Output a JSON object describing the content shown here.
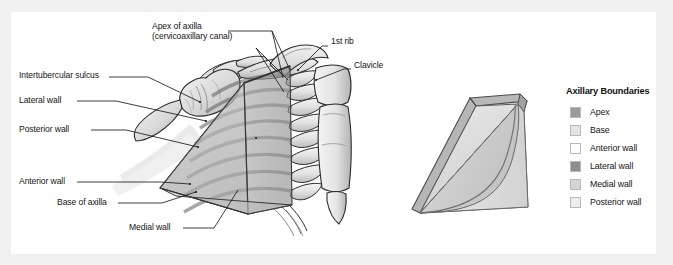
{
  "figure": {
    "panel_background": "#ffffff",
    "outer_background": "#f0f0f0"
  },
  "labels": {
    "apex_of_axilla": "Apex of axilla",
    "cervicoaxillary_canal": "(cervicoaxillary canal)",
    "first_rib": "1st rib",
    "clavicle": "Clavicle",
    "intertubercular_sulcus": "Intertubercular sulcus",
    "lateral_wall": "Lateral wall",
    "posterior_wall": "Posterior wall",
    "anterior_wall": "Anterior wall",
    "base_of_axilla": "Base of axilla",
    "medial_wall": "Medial wall"
  },
  "legend": {
    "title": "Axillary Boundaries",
    "items": [
      {
        "label": "Apex",
        "color": "#9a9a9a"
      },
      {
        "label": "Base",
        "color": "#e4e4e4"
      },
      {
        "label": "Anterior wall",
        "color": "#ffffff"
      },
      {
        "label": "Lateral wall",
        "color": "#8e8e8e"
      },
      {
        "label": "Medial wall",
        "color": "#d4d4d4"
      },
      {
        "label": "Posterior wall",
        "color": "#ededed"
      }
    ]
  },
  "colors": {
    "line": "#1c1c1c",
    "bone_light": "#efefef",
    "bone_mid": "#d2d2d2",
    "bone_shadow": "#a8a8a8",
    "pyramid_anterior": "#b5b5b5",
    "pyramid_medial": "#9e9e9e",
    "pyramid_base": "#c6c6c6",
    "pyramid_lateral": "#8e8e8e",
    "pyramid_right_light": "#e3e3e3",
    "pyramid_right_mid": "#cfcfcf",
    "pyramid_right_dark": "#b0b0b0",
    "text": "#161616"
  }
}
